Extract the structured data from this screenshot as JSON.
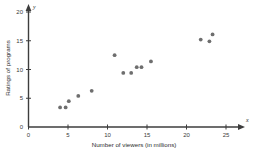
{
  "chart_data": {
    "type": "scatter",
    "title": "",
    "xlabel": "Number of viewers (in millions)",
    "ylabel": "Ratings of programs",
    "x_axis_variable": "x",
    "y_axis_variable": "y",
    "xlim": [
      0,
      26
    ],
    "ylim": [
      0,
      21
    ],
    "xticks": [
      0,
      5,
      10,
      15,
      20,
      25
    ],
    "yticks": [
      0,
      5,
      10,
      15,
      20
    ],
    "xtick_labels": [
      "0",
      "5",
      "10",
      "15",
      "20",
      "25"
    ],
    "ytick_labels": [
      "0",
      "5",
      "10",
      "15",
      "20"
    ],
    "grid": false,
    "legend": false,
    "point_color": "#6e6e6e",
    "axis_color": "#3d3d3d",
    "points": [
      {
        "x": 4.0,
        "y": 3.4
      },
      {
        "x": 4.7,
        "y": 3.4
      },
      {
        "x": 5.1,
        "y": 4.5
      },
      {
        "x": 6.3,
        "y": 5.4
      },
      {
        "x": 8.0,
        "y": 6.3
      },
      {
        "x": 10.9,
        "y": 12.5
      },
      {
        "x": 12.0,
        "y": 9.4
      },
      {
        "x": 13.0,
        "y": 9.4
      },
      {
        "x": 13.7,
        "y": 10.4
      },
      {
        "x": 14.3,
        "y": 10.4
      },
      {
        "x": 15.5,
        "y": 11.4
      },
      {
        "x": 21.8,
        "y": 15.2
      },
      {
        "x": 22.9,
        "y": 14.9
      },
      {
        "x": 23.3,
        "y": 16.1
      }
    ]
  }
}
